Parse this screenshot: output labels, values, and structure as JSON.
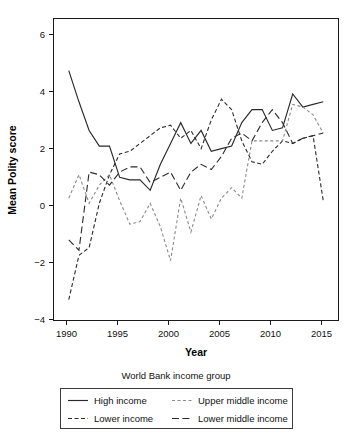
{
  "chart_data": {
    "type": "line",
    "title": "",
    "xlabel": "Year",
    "ylabel": "Mean Polity score",
    "xlim": [
      1988.5,
      2016.5
    ],
    "ylim": [
      -4.4,
      7.2
    ],
    "grid": false,
    "legend_position": "bottom",
    "legend_title": "World Bank income group",
    "x": [
      1990,
      1991,
      1992,
      1993,
      1994,
      1995,
      1996,
      1997,
      1998,
      1999,
      2000,
      2001,
      2002,
      2003,
      2004,
      2005,
      2006,
      2007,
      2008,
      2009,
      2010,
      2011,
      2012,
      2013,
      2014,
      2015
    ],
    "xticks": [
      1990,
      1995,
      2000,
      2005,
      2010,
      2015
    ],
    "yticks": [
      -4,
      -2,
      0,
      2,
      4,
      6
    ],
    "series": [
      {
        "name": "High income",
        "style": "solid",
        "color": "#2a2a2a",
        "values": [
          5.2,
          4.0,
          2.9,
          2.3,
          2.3,
          1.1,
          1.0,
          1.0,
          0.6,
          1.6,
          2.4,
          3.2,
          2.4,
          2.9,
          2.1,
          2.2,
          2.3,
          3.2,
          3.7,
          3.7,
          2.9,
          3.0,
          4.3,
          3.8,
          3.9,
          4.0
        ]
      },
      {
        "name": "Lower income",
        "style": "dotted-dash",
        "color": "#2a2a2a",
        "values": [
          -3.6,
          -1.9,
          -1.6,
          0.1,
          1.2,
          2.0,
          2.1,
          2.4,
          2.7,
          3.0,
          3.1,
          2.6,
          2.9,
          2.2,
          3.3,
          4.1,
          3.7,
          2.5,
          1.7,
          1.6,
          2.1,
          2.5,
          2.4,
          2.6,
          2.7,
          0.2
        ]
      },
      {
        "name": "Upper middle income",
        "style": "fine-dash",
        "color": "#8a8a8a",
        "values": [
          0.3,
          1.2,
          0.1,
          0.8,
          1.2,
          0.2,
          -0.7,
          -0.6,
          0.1,
          -0.8,
          -2.1,
          0.3,
          -1.0,
          0.4,
          -0.5,
          0.3,
          0.7,
          0.3,
          2.5,
          2.5,
          2.5,
          2.5,
          3.9,
          3.8,
          3.5,
          2.8
        ]
      },
      {
        "name": "Lower middle income",
        "style": "long-dash",
        "color": "#2a2a2a",
        "values": [
          -1.3,
          -1.7,
          1.3,
          1.2,
          0.8,
          1.3,
          1.5,
          1.5,
          0.9,
          1.1,
          1.3,
          0.6,
          1.3,
          1.6,
          1.4,
          1.9,
          2.6,
          2.8,
          2.5,
          3.2,
          3.7,
          3.2,
          2.4,
          2.6,
          2.7,
          2.8
        ]
      }
    ]
  },
  "legend": {
    "title": "World Bank income group",
    "entries": [
      {
        "label": "High income",
        "style": "solid"
      },
      {
        "label": "Upper middle income",
        "style": "fine-dash"
      },
      {
        "label": "Lower income",
        "style": "dotted-dash"
      },
      {
        "label": "Lower middle income",
        "style": "long-dash"
      }
    ]
  },
  "axes": {
    "x_title": "Year",
    "y_title": "Mean Polity score",
    "x_tick_labels": [
      "1990",
      "1995",
      "2000",
      "2005",
      "2010",
      "2015"
    ],
    "y_tick_labels": [
      "6",
      "4",
      "2",
      "0",
      "−2",
      "−4"
    ]
  }
}
